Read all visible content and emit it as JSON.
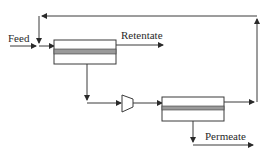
{
  "diagram": {
    "type": "membrane-process-flow",
    "labels": {
      "feed": "Feed",
      "retentate": "Retentate",
      "permeate": "Permeate"
    },
    "nodes": [
      {
        "id": "membrane-module-1",
        "kind": "membrane-module"
      },
      {
        "id": "compressor",
        "kind": "compressor"
      },
      {
        "id": "membrane-module-2",
        "kind": "membrane-module"
      }
    ],
    "edges": [
      {
        "from": "feed",
        "to": "membrane-module-1"
      },
      {
        "from": "membrane-module-1",
        "to": "retentate",
        "stream": "retentate"
      },
      {
        "from": "membrane-module-1",
        "to": "compressor",
        "stream": "permeate-1"
      },
      {
        "from": "compressor",
        "to": "membrane-module-2"
      },
      {
        "from": "membrane-module-2",
        "to": "permeate",
        "stream": "permeate"
      },
      {
        "from": "membrane-module-2",
        "to": "membrane-module-1",
        "stream": "recycle"
      }
    ],
    "colors": {
      "line": "#3a3a3a",
      "membrane_band": "#9a9a9a",
      "background": "#ffffff"
    }
  }
}
